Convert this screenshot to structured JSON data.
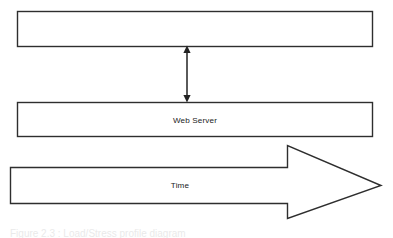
{
  "figure": {
    "background_color": "#ffffff",
    "stroke_color": "#2e2e2e",
    "text_color": "#1b1b1b",
    "caption": "Figure 2.3 : Load/Stress profile diagram"
  },
  "diagram": {
    "type": "block-diagram",
    "top_box": {
      "label": "",
      "x": 17,
      "y": 11,
      "width": 355,
      "height": 35
    },
    "web_server_box": {
      "label": "Web Server",
      "x": 17,
      "y": 102,
      "width": 355,
      "height": 34
    },
    "vertical_arrow": {
      "label": "",
      "kind": "double-headed",
      "x": 187,
      "y_top": 46,
      "y_bottom": 102
    },
    "time_arrow": {
      "label": "Time",
      "direction": "right",
      "body_x": 10,
      "body_y": 167,
      "body_width": 278,
      "body_height": 37,
      "head_top": 145,
      "head_bottom": 218,
      "tip_x": 381,
      "tip_y": 185
    }
  },
  "labels": {
    "web_server": "Web Server",
    "time": "Time"
  }
}
